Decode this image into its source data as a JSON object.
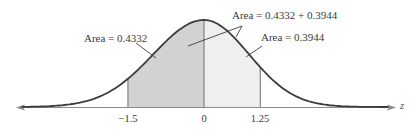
{
  "diagram": {
    "axis_label": "z",
    "ticks": [
      {
        "label": "−1.5",
        "value": -1.5
      },
      {
        "label": "0",
        "value": 0
      },
      {
        "label": "1.25",
        "value": 1.25
      }
    ],
    "annotations": {
      "left_area": "Area = 0.4332",
      "combined_area": "Area = 0.4332 + 0.3944",
      "right_area": "Area = 0.3944"
    },
    "regions": [
      {
        "name": "left-shaded",
        "from": -1.5,
        "to": 0,
        "area": 0.4332,
        "color": "#d2d2d2"
      },
      {
        "name": "right-shaded",
        "from": 0,
        "to": 1.25,
        "area": 0.3944,
        "color": "#efefef"
      }
    ],
    "colors": {
      "curve": "#3c3c3c",
      "axis": "#8a8a8a",
      "divider": "#6e6e6e",
      "text": "#3a3a3a"
    }
  }
}
